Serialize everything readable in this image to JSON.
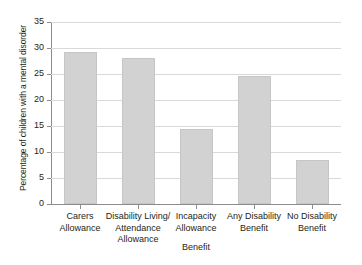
{
  "chart_data": {
    "type": "bar",
    "title": "",
    "xlabel": "Benefit",
    "ylabel": "Percentage of children with a mental disorder",
    "categories": [
      "Carers\nAllowance",
      "Disability Living/\nAttendance\nAllowance",
      "Incapacity\nAllowance",
      "Any Disability\nBenefit",
      "No Disability\nBenefit"
    ],
    "category_lines": [
      [
        "Carers",
        "Allowance"
      ],
      [
        "Disability Living/",
        "Attendance",
        "Allowance"
      ],
      [
        "Incapacity",
        "Allowance"
      ],
      [
        "Any Disability",
        "Benefit"
      ],
      [
        "No Disability",
        "Benefit"
      ]
    ],
    "values": [
      29.2,
      28.0,
      14.4,
      24.6,
      8.5
    ],
    "ylim": [
      0,
      35
    ],
    "yticks": [
      0,
      5,
      10,
      15,
      20,
      25,
      30,
      35
    ],
    "ytick_labels": [
      "0",
      "5",
      "10",
      "15",
      "20",
      "25",
      "30",
      "35"
    ],
    "grid": "horizontal",
    "legend": "none",
    "bar_color": "#d2d2d2",
    "bar_edge_color": "#c6c6c6",
    "axis_color": "#8c8c8c",
    "grid_color": "#d9d9d9",
    "background_color": "#ffffff",
    "text_color": "#231f20"
  }
}
